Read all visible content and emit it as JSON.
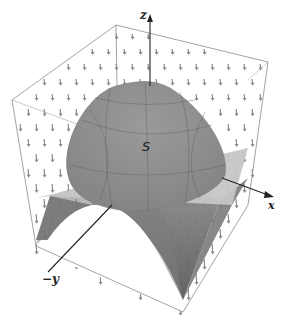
{
  "figure": {
    "type": "3d-surface-diagram"
  },
  "labels": {
    "z_axis": "z",
    "x_axis": "x",
    "y_axis": "−y",
    "surface": "S"
  },
  "colors": {
    "cap_surface": "#8c8c8c",
    "plane": "#c4c4c4",
    "lower_surface": "#6e6e6e",
    "box_edges": "#9a9a9a",
    "vector_field": "#8a8a8a",
    "axes": "#222222"
  }
}
